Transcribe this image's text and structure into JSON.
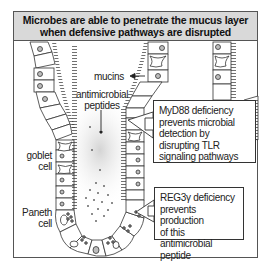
{
  "figure": {
    "title": "Microbes are able to penetrate the mucus layer when defensive pathways are disrupted",
    "colors": {
      "title_background": "#d9d9d9",
      "frame_border": "#555555",
      "cell_outline": "#333333",
      "nucleus_fill": "#bdbdbd",
      "glow": "#cfcfcf"
    }
  },
  "labels": {
    "mucins": "mucins",
    "antimicrobial_peptides_line1": "antimicrobial",
    "antimicrobial_peptides_line2": "peptides",
    "goblet_cell_line1": "goblet",
    "goblet_cell_line2": "cell",
    "paneth_cell_line1": "Paneth",
    "paneth_cell_line2": "cell"
  },
  "callouts": {
    "myd88": {
      "line1": "MyD88 deficiency",
      "line2": "prevents microbial",
      "line3": "detection by",
      "line4": "disrupting TLR",
      "line5": "signaling pathways"
    },
    "reg3g": {
      "line1": "REG3γ deficiency",
      "line2": "prevents production",
      "line3": "of this antimicrobial",
      "line4": "peptide"
    }
  }
}
